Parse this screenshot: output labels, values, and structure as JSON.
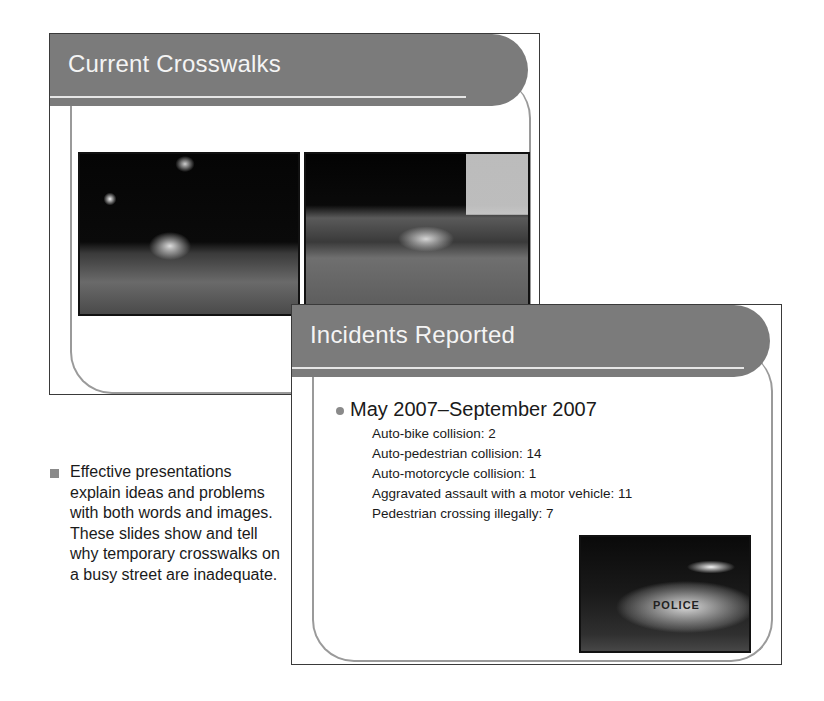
{
  "slides": [
    {
      "title": "Current Crosswalks",
      "images": [
        {
          "description": "Night street scene with pedestrians crossing and car headlights"
        },
        {
          "description": "Night street scene with parked cars and temporary crosswalk posts"
        }
      ]
    },
    {
      "title": "Incidents Reported",
      "bullet": "May 2007–September 2007",
      "items": [
        {
          "label": "Auto-bike collision",
          "count": "2",
          "text": "Auto-bike collision: 2"
        },
        {
          "label": "Auto-pedestrian collision",
          "count": "14",
          "text": "Auto-pedestrian collision: 14"
        },
        {
          "label": "Auto-motorcycle collision",
          "count": "1",
          "text": "Auto-motorcycle collision: 1"
        },
        {
          "label": "Aggravated assault with a motor vehicle",
          "count": "11",
          "text": "Aggravated assault with a motor vehicle: 11"
        },
        {
          "label": "Pedestrian crossing illegally",
          "count": "7",
          "text": "Pedestrian crossing illegally: 7"
        }
      ],
      "image": {
        "description": "Police car at night with officers",
        "label": "POLICE"
      }
    }
  ],
  "caption": {
    "text": "Effective presentations explain ideas and problems with both words and images. These slides show and tell why temporary crosswalks on a busy street are inadequate."
  },
  "colors": {
    "title_bar": "#7b7b7b",
    "title_text": "#f4f4f4",
    "frame": "#9a9a9a",
    "bullet": "#8a8a8a"
  }
}
